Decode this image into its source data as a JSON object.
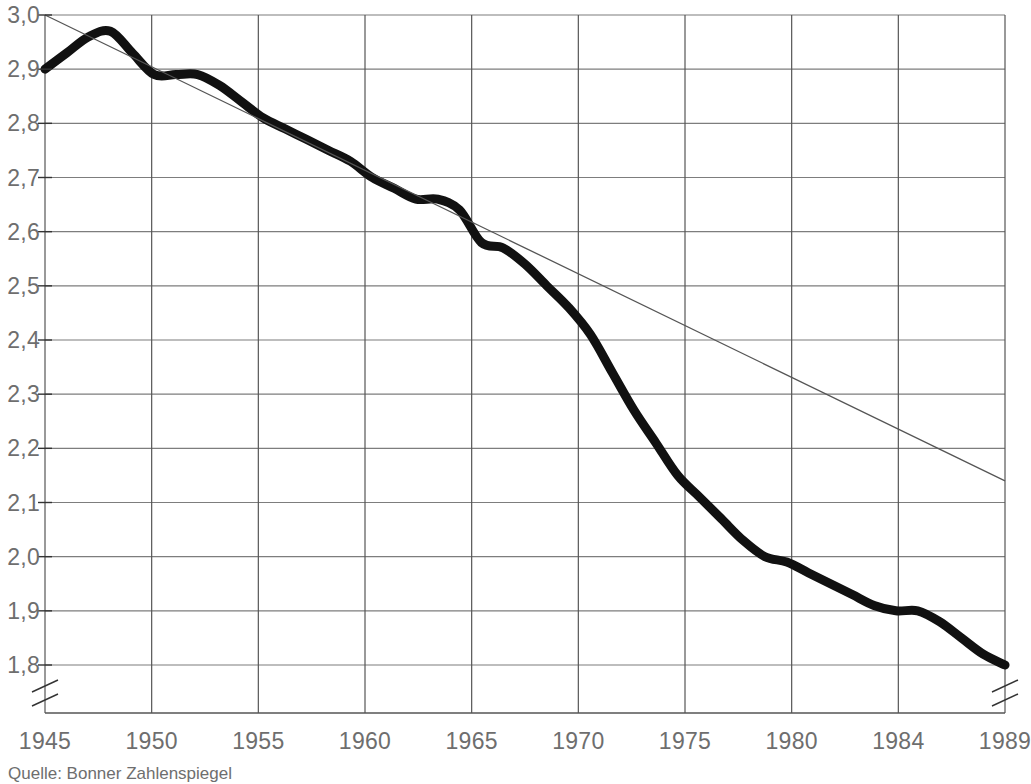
{
  "chart_data": {
    "type": "line",
    "title": "",
    "subtitle": "",
    "xlabel": "",
    "ylabel": "",
    "source_note": "Quelle: Bonner Zahlenspiegel",
    "grid": true,
    "legend_position": "none",
    "y_axis_break": true,
    "xlim": [
      1945,
      1989
    ],
    "ylim": [
      1.8,
      3.0
    ],
    "yticks": [
      3.0,
      2.9,
      2.8,
      2.7,
      2.6,
      2.5,
      2.4,
      2.3,
      2.2,
      2.1,
      2.0,
      1.9,
      1.8
    ],
    "ytick_labels": [
      "3,0",
      "2,9",
      "2,8",
      "2,7",
      "2,6",
      "2,5",
      "2,4",
      "2,3",
      "2,2",
      "2,1",
      "2,0",
      "1,9",
      "1,8"
    ],
    "xticks": [
      1945,
      1950,
      1955,
      1960,
      1965,
      1970,
      1975,
      1980,
      1984,
      1989
    ],
    "xtick_labels": [
      "1945",
      "1950",
      "1955",
      "1960",
      "1965",
      "1970",
      "1975",
      "1980",
      "1984",
      "1989"
    ],
    "series": [
      {
        "name": "Durchschnittliche Haushaltsgroesse",
        "style": "thick-curve",
        "color": "#111111",
        "x": [
          1945,
          1946,
          1947,
          1948,
          1949,
          1950,
          1951,
          1952,
          1953,
          1954,
          1955,
          1956,
          1957,
          1958,
          1959,
          1960,
          1961,
          1962,
          1963,
          1964,
          1965,
          1966,
          1967,
          1968,
          1969,
          1970,
          1971,
          1972,
          1973,
          1974,
          1975,
          1976,
          1977,
          1978,
          1979,
          1980,
          1981,
          1982,
          1983,
          1984,
          1985,
          1986,
          1987,
          1988,
          1989
        ],
        "values": [
          2.9,
          2.93,
          2.96,
          2.97,
          2.93,
          2.89,
          2.89,
          2.89,
          2.87,
          2.84,
          2.81,
          2.79,
          2.77,
          2.75,
          2.73,
          2.7,
          2.68,
          2.66,
          2.66,
          2.64,
          2.58,
          2.57,
          2.54,
          2.5,
          2.46,
          2.41,
          2.34,
          2.27,
          2.21,
          2.15,
          2.11,
          2.07,
          2.03,
          2.0,
          1.99,
          1.97,
          1.95,
          1.93,
          1.91,
          1.9,
          1.9,
          1.88,
          1.85,
          1.82,
          1.8
        ]
      },
      {
        "name": "Trendlinie",
        "style": "thin-straight",
        "color": "#555555",
        "x": [
          1945,
          1989
        ],
        "values": [
          3.0,
          2.14
        ]
      }
    ]
  },
  "axis": {
    "break_symbol": "axis-break",
    "y_break_between": [
      1.8,
      1.74
    ]
  }
}
